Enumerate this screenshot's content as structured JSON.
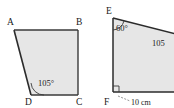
{
  "figure": {
    "background_color": "#ffffff",
    "shape_fill_color": "#e6e6e6",
    "shape_stroke_color": "#3a3a3a",
    "label_color": "#202020"
  },
  "shape_left": {
    "name": "quadrilateral-abcd",
    "type": "quadrilateral",
    "vertices": [
      {
        "id": "A",
        "label": "A",
        "x": 14,
        "y": 30
      },
      {
        "id": "B",
        "label": "B",
        "x": 78,
        "y": 30
      },
      {
        "id": "C",
        "label": "C",
        "x": 78,
        "y": 95
      },
      {
        "id": "D",
        "label": "D",
        "x": 31,
        "y": 95
      }
    ],
    "vertex_label_positions": [
      {
        "id": "A",
        "label": "A",
        "x": 7,
        "y": 25
      },
      {
        "id": "B",
        "label": "B",
        "x": 76,
        "y": 25
      },
      {
        "id": "C",
        "label": "C",
        "x": 76,
        "y": 105
      },
      {
        "id": "D",
        "label": "D",
        "x": 25,
        "y": 105
      }
    ],
    "angles": [
      {
        "at": "D",
        "label": "105°",
        "value": 105,
        "unit": "degrees",
        "label_x": 38,
        "label_y": 85
      }
    ]
  },
  "shape_right": {
    "name": "quadrilateral-ef-clipped",
    "type": "quadrilateral",
    "note": "right edge clipped by image border",
    "vertices": [
      {
        "id": "E",
        "label": "E",
        "x": 113,
        "y": 18
      },
      {
        "id": "TR",
        "label": "",
        "x": 176,
        "y": 34
      },
      {
        "id": "BR",
        "label": "",
        "x": 176,
        "y": 92
      },
      {
        "id": "F",
        "label": "F",
        "x": 113,
        "y": 92
      }
    ],
    "vertex_label_positions": [
      {
        "id": "E",
        "label": "E",
        "x": 106,
        "y": 13
      },
      {
        "id": "F",
        "label": "F",
        "x": 105,
        "y": 104
      }
    ],
    "angles": [
      {
        "at": "E",
        "label": "60°",
        "value": 60,
        "unit": "degrees",
        "label_x": 117,
        "label_y": 30
      },
      {
        "at": "interior-right",
        "label": "105",
        "value": 105,
        "unit": "degrees",
        "label_x": 152,
        "label_y": 45
      },
      {
        "at": "F",
        "label": "",
        "value": 90,
        "unit": "degrees",
        "marker": "right-angle-square"
      }
    ],
    "dimensions": [
      {
        "label": "10 cm",
        "value": 10,
        "unit": "cm",
        "from": "F",
        "along": "bottom-edge",
        "label_x": 132,
        "label_y": 104
      }
    ]
  }
}
